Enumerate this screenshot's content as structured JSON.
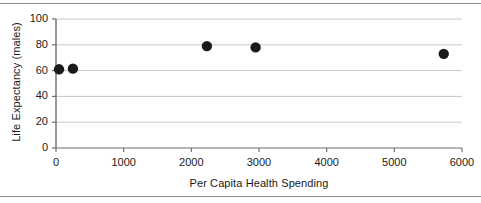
{
  "chart_data": {
    "type": "scatter",
    "title": "",
    "xlabel": "Per Capita Health Spending",
    "ylabel": "Life Expectancy (males)",
    "xlim": [
      0,
      6000
    ],
    "ylim": [
      0,
      100
    ],
    "xticks": [
      0,
      1000,
      2000,
      3000,
      4000,
      5000,
      6000
    ],
    "yticks": [
      0,
      20,
      40,
      60,
      80,
      100
    ],
    "xtick_labels": [
      "0",
      "1000",
      "2000",
      "3000",
      "4000",
      "5000",
      "6000"
    ],
    "ytick_labels": [
      "0",
      "20",
      "40",
      "60",
      "80",
      "100"
    ],
    "grid": "horizontal",
    "legend": "none",
    "marker": "filled-circle",
    "marker_color": "#1a1a1a",
    "points": [
      {
        "x": 45,
        "y": 61.0
      },
      {
        "x": 250,
        "y": 61.5
      },
      {
        "x": 2230,
        "y": 79.0
      },
      {
        "x": 2950,
        "y": 78.0
      },
      {
        "x": 5730,
        "y": 73.0
      }
    ]
  },
  "style": {
    "axis_color": "#6e6e6e",
    "grid_color": "#c8c8c8",
    "frame_color": "#8c8c8c",
    "text_color": "#1a1a1a",
    "background": "#ffffff"
  }
}
